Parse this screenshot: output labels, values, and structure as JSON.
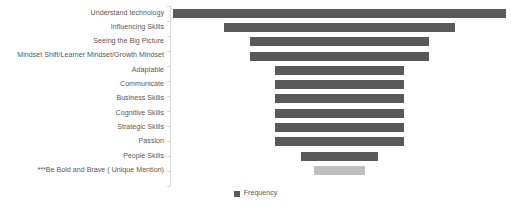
{
  "chart_data": {
    "type": "bar",
    "orientation": "horizontal",
    "style": "funnel",
    "title": "",
    "xlabel": "",
    "ylabel": "",
    "categories": [
      "Understand technology",
      "Influencing Skills",
      "Seeing the Big Picture",
      "Mindset Shift/Learner Mindset/Growth Mindset",
      "Adaptable",
      "Communicate",
      "Business Skills",
      "Cognitive Skills",
      "Strategic Skills",
      "Passion",
      "People Skills",
      "***Be Bold and Brave ( Unique Mention)"
    ],
    "series": [
      {
        "name": "Frequency",
        "values": [
          13,
          9,
          7,
          7,
          5,
          5,
          5,
          5,
          5,
          5,
          3,
          2
        ]
      }
    ],
    "xlim": [
      0,
      13
    ],
    "grid": false,
    "legend": {
      "position": "bottom",
      "entries": [
        {
          "label": "Frequency",
          "color": "#595959"
        }
      ]
    },
    "colors": {
      "bar": "#595959",
      "bar_highlight": "#bfbfbf",
      "text": "#595959",
      "axis": "#d9d9d9",
      "background": "#ffffff"
    },
    "highlight_index": 11
  }
}
